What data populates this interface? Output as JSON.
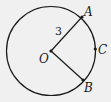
{
  "diagram": {
    "type": "circle-geometry",
    "circle": {
      "center_label": "O",
      "radius_label": "3"
    },
    "points": [
      {
        "id": "A",
        "label": "A"
      },
      {
        "id": "B",
        "label": "B"
      },
      {
        "id": "C",
        "label": "C"
      },
      {
        "id": "O",
        "label": "O"
      }
    ],
    "segments": [
      "OA",
      "OB"
    ],
    "colors": {
      "stroke": "#1a1a1a",
      "background": "#f0f0f0"
    }
  }
}
